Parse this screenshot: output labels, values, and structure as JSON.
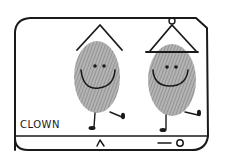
{
  "illustration": {
    "caption": "CLOWN",
    "style": "hand-drawn fingerprint art",
    "colors": {
      "ink": "#1a1a1a",
      "fingerprint": "#9a9a9a",
      "background": "#ffffff"
    },
    "figures": [
      {
        "name": "clown-left",
        "hat": "pointed-hat",
        "expression": "smile"
      },
      {
        "name": "clown-right",
        "hat": "pointed-hat-with-brim-and-pompom",
        "expression": "smile"
      }
    ],
    "frame": {
      "bottom_bar": {
        "caret_symbol": "^",
        "indicator": "dash-circle"
      }
    }
  }
}
